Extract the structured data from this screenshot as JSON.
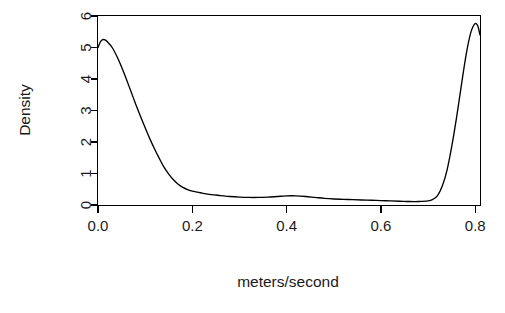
{
  "chart_data": {
    "type": "line",
    "title": "",
    "subtitle": "",
    "xlabel": "meters/second",
    "ylabel": "Density",
    "xlim": [
      0.0,
      0.81
    ],
    "ylim": [
      0,
      6
    ],
    "xticks": [
      0.0,
      0.2,
      0.4,
      0.6,
      0.8
    ],
    "xticklabels": [
      "0.0",
      "0.2",
      "0.4",
      "0.6",
      "0.8"
    ],
    "yticks": [
      0,
      1,
      2,
      3,
      4,
      5,
      6
    ],
    "yticklabels": [
      "0",
      "1",
      "2",
      "3",
      "4",
      "5",
      "6"
    ],
    "grid": false,
    "legend": null,
    "legend_position": "none",
    "line_color": "#000000",
    "background_color": "#ffffff",
    "series": [
      {
        "name": "Density",
        "x": [
          0.0,
          0.005,
          0.01,
          0.015,
          0.02,
          0.03,
          0.04,
          0.05,
          0.06,
          0.07,
          0.08,
          0.09,
          0.1,
          0.11,
          0.12,
          0.13,
          0.14,
          0.15,
          0.16,
          0.17,
          0.18,
          0.19,
          0.2,
          0.22,
          0.24,
          0.26,
          0.28,
          0.3,
          0.32,
          0.34,
          0.36,
          0.38,
          0.4,
          0.42,
          0.44,
          0.46,
          0.48,
          0.5,
          0.52,
          0.54,
          0.56,
          0.58,
          0.6,
          0.62,
          0.64,
          0.66,
          0.68,
          0.7,
          0.71,
          0.72,
          0.73,
          0.74,
          0.75,
          0.76,
          0.77,
          0.775,
          0.78,
          0.785,
          0.79,
          0.795,
          0.8,
          0.803,
          0.806,
          0.81
        ],
        "y": [
          5.0,
          5.18,
          5.25,
          5.24,
          5.18,
          5.0,
          4.72,
          4.38,
          4.0,
          3.6,
          3.2,
          2.82,
          2.45,
          2.1,
          1.78,
          1.48,
          1.2,
          0.98,
          0.8,
          0.66,
          0.56,
          0.49,
          0.44,
          0.38,
          0.33,
          0.3,
          0.27,
          0.25,
          0.24,
          0.24,
          0.25,
          0.27,
          0.29,
          0.29,
          0.27,
          0.24,
          0.21,
          0.19,
          0.18,
          0.17,
          0.16,
          0.15,
          0.14,
          0.13,
          0.12,
          0.11,
          0.11,
          0.13,
          0.18,
          0.3,
          0.6,
          1.1,
          1.85,
          2.75,
          3.75,
          4.25,
          4.72,
          5.12,
          5.45,
          5.66,
          5.76,
          5.74,
          5.66,
          5.4
        ]
      }
    ],
    "annotations": [
      {
        "name": "left-peak",
        "description": "Sharp mode near zero velocity",
        "x": 0.01,
        "y": 5.25
      },
      {
        "name": "middle-plateau",
        "description": "Low flat region with slight bump",
        "x": 0.4,
        "y": 0.29
      },
      {
        "name": "right-peak",
        "description": "Sharp mode at upper boundary",
        "x": 0.8,
        "y": 5.76
      }
    ]
  },
  "axes": {
    "x_axis_name": "x-axis",
    "y_axis_name": "y-axis"
  }
}
